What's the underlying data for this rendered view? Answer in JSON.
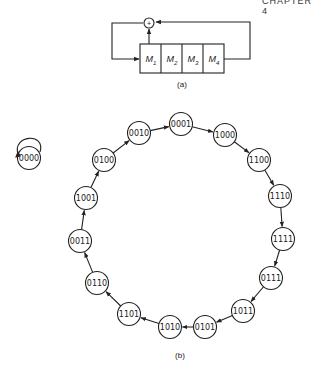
{
  "header": {
    "text": "CHAPTER 4"
  },
  "figure_a": {
    "label": "(a)",
    "cells": [
      "M1",
      "M2",
      "M3",
      "M4"
    ],
    "cell_labels": [
      {
        "m": "M",
        "sub": "1"
      },
      {
        "m": "M",
        "sub": "2"
      },
      {
        "m": "M",
        "sub": "3"
      },
      {
        "m": "M",
        "sub": "4"
      }
    ],
    "adder_symbol": "+"
  },
  "figure_b": {
    "label": "(b)",
    "isolated_state": "0000",
    "cycle": [
      "0001",
      "1000",
      "1100",
      "1110",
      "1111",
      "0111",
      "1011",
      "0101",
      "1010",
      "1101",
      "0110",
      "0011",
      "1001",
      "0100",
      "0010"
    ]
  }
}
